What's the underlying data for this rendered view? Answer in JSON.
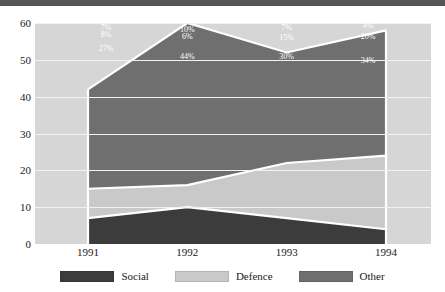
{
  "chart_data": {
    "type": "area",
    "stacked": true,
    "title": "",
    "xlabel": "",
    "ylabel": "",
    "categories": [
      "1991",
      "1992",
      "1993",
      "1994"
    ],
    "ylim": [
      0,
      60
    ],
    "yticks": [
      "0",
      "10",
      "20",
      "30",
      "40",
      "50",
      "60"
    ],
    "grid": true,
    "legend_position": "bottom",
    "series": [
      {
        "name": "Social",
        "color": "#3c3c3c",
        "values": [
          7,
          10,
          7,
          4
        ],
        "labels": [
          "7%",
          "10%",
          "7%",
          "4%"
        ]
      },
      {
        "name": "Defence",
        "color": "#c9c9c9",
        "values": [
          8,
          6,
          15,
          20
        ],
        "labels": [
          "8%",
          "6%",
          "15%",
          "20%"
        ]
      },
      {
        "name": "Other",
        "color": "#6f6f6f",
        "values": [
          27,
          44,
          30,
          34
        ],
        "labels": [
          "27%",
          "44%",
          "30%",
          "34%"
        ]
      }
    ],
    "cumulative_tops": {
      "social": [
        7,
        10,
        7,
        4
      ],
      "social_defence": [
        15,
        16,
        22,
        24
      ],
      "total": [
        42,
        60,
        52,
        58
      ]
    },
    "plot_background": "#d6d6d6",
    "gridline_color": "#f2f2f2",
    "separator_color": "#ffffff",
    "header_bar_color": "#555555"
  },
  "yticks": {
    "t0": "0",
    "t1": "10",
    "t2": "20",
    "t3": "30",
    "t4": "40",
    "t5": "50",
    "t6": "60"
  },
  "xticks": {
    "t0": "1991",
    "t1": "1992",
    "t2": "1993",
    "t3": "1994"
  },
  "legend": {
    "items": [
      {
        "label": "Social",
        "color": "#3c3c3c"
      },
      {
        "label": "Defence",
        "color": "#c9c9c9"
      },
      {
        "label": "Other",
        "color": "#6f6f6f"
      }
    ]
  },
  "data_labels": {
    "other": [
      "27%",
      "44%",
      "30%",
      "34%"
    ],
    "defence": [
      "8%",
      "6%",
      "15%",
      "20%"
    ],
    "social": [
      "7%",
      "10%",
      "7%",
      "4%"
    ]
  }
}
